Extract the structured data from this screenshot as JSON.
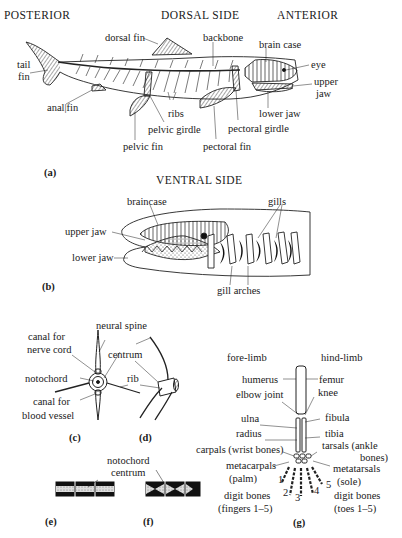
{
  "panel_a": {
    "headers": {
      "posterior": "POSTERIOR",
      "dorsal": "DORSAL SIDE",
      "anterior": "ANTERIOR"
    },
    "labels": {
      "dorsal_fin": "dorsal fin",
      "backbone": "backbone",
      "brain_case": "brain case",
      "eye": "eye",
      "tail_fin_1": "tail",
      "tail_fin_2": "fin",
      "upper_jaw_1": "upper",
      "upper_jaw_2": "jaw",
      "anal_fin": "anal|fin",
      "ribs": "ribs",
      "lower_jaw": "lower jaw",
      "pelvic_girdle": "pelvic girdle",
      "pectoral_girdle": "pectoral girdle",
      "pelvic_fin": "pelvic fin",
      "pectoral_fin": "pectoral fin"
    },
    "caption": "(a)"
  },
  "panel_b": {
    "header": "VENTRAL SIDE",
    "labels": {
      "braincase": "braincase",
      "gills": "gills",
      "upper_jaw": "upper jaw",
      "lower_jaw": "lower jaw",
      "gill_arches": "gill arches"
    },
    "caption": "(b)"
  },
  "panel_c": {
    "labels": {
      "neural_spine": "neural spine",
      "canal_nerve_1": "canal for",
      "canal_nerve_2": "nerve cord",
      "centrum": "centrum",
      "notochord": "notochord",
      "rib": "rib",
      "canal_blood_1": "canal for",
      "canal_blood_2": "blood vessel"
    },
    "caption": "(c)"
  },
  "panel_d": {
    "caption": "(d)"
  },
  "panel_ef": {
    "labels": {
      "notochord": "notochord",
      "centrum": "centrum"
    },
    "caption_e": "(e)",
    "caption_f": "(f)"
  },
  "panel_g": {
    "labels": {
      "fore_limb": "fore-limb",
      "hind_limb": "hind-limb",
      "humerus": "humerus",
      "femur": "femur",
      "elbow_joint": "elbow joint",
      "knee": "knee",
      "ulna": "ulna",
      "fibula": "fibula",
      "radius": "radius",
      "tibia": "tibia",
      "carpals": "carpals (wrist bones)",
      "tarsals_1": "tarsals (ankle",
      "tarsals_2": "bones)",
      "metacarpals_1": "metacarpals",
      "metacarpals_2": "(palm)",
      "metatarsals_1": "metatarsals",
      "metatarsals_2": "(sole)",
      "digit_1": "1",
      "digit_2": "2",
      "digit_3": "3",
      "digit_4": "4",
      "digit_5": "5",
      "digit_fingers_1": "digit bones",
      "digit_fingers_2": "(fingers 1–5)",
      "digit_toes_1": "digit bones",
      "digit_toes_2": "(toes 1–5)"
    },
    "caption": "(g)"
  }
}
